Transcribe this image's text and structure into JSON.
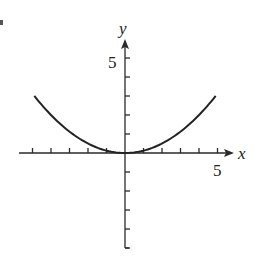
{
  "chart_data": {
    "type": "line",
    "title": "",
    "xlabel": "x",
    "ylabel": "y",
    "xlim": [
      -5.5,
      5.8
    ],
    "ylim": [
      -5,
      5.8
    ],
    "x_ticks": [
      -5,
      -4,
      -3,
      -2,
      -1,
      1,
      2,
      3,
      4,
      5
    ],
    "y_ticks": [
      -5,
      -4,
      -3,
      -2,
      -1,
      1,
      2,
      3,
      4,
      5
    ],
    "x_tick_labels": {
      "5": "5"
    },
    "y_tick_labels": {
      "5": "5"
    },
    "grid": false,
    "legend": null,
    "series": [
      {
        "name": "y = x^2/8",
        "x": [
          -4.9,
          -4,
          -3,
          -2,
          -1,
          0,
          1,
          2,
          3,
          4,
          4.9
        ],
        "values": [
          3.0,
          2.0,
          1.125,
          0.5,
          0.125,
          0,
          0.125,
          0.5,
          1.125,
          2.0,
          3.0
        ]
      }
    ]
  },
  "labels": {
    "x_axis": "x",
    "y_axis": "y",
    "x_tick_5": "5",
    "y_tick_5": "5"
  },
  "colors": {
    "axis": "#2a2a2a",
    "curve": "#222222"
  }
}
